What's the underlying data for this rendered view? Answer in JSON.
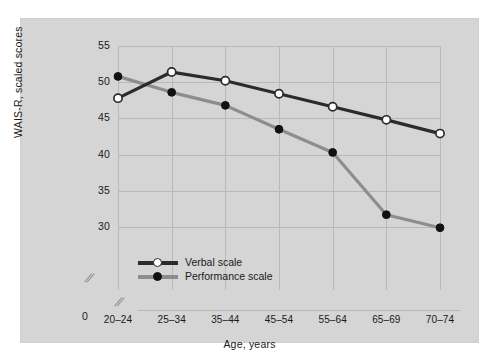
{
  "chart_data": {
    "type": "line",
    "title": "",
    "xlabel": "Age, years",
    "ylabel": "WAIS-R, scaled scores",
    "categories": [
      "20–24",
      "25–34",
      "35–44",
      "45–54",
      "55–64",
      "65–69",
      "70–74"
    ],
    "ylim": [
      28.5,
      55
    ],
    "yticks": [
      55,
      50,
      45,
      40,
      35,
      30
    ],
    "ytick_zero": "0",
    "grid": true,
    "legend_position": "bottom-left",
    "axis_break": "//",
    "series": [
      {
        "name": "Verbal scale",
        "color": "#2b2b2b",
        "marker": "open-circle",
        "values": [
          47.8,
          51.4,
          50.2,
          48.4,
          46.6,
          44.8,
          42.9
        ]
      },
      {
        "name": "Performance scale",
        "color": "#8d8d8d",
        "marker": "filled-circle",
        "values": [
          50.8,
          48.6,
          46.8,
          43.5,
          40.3,
          31.7,
          29.9
        ]
      }
    ]
  },
  "panel": {
    "background_color": "#d5d5d5",
    "gridline_color": "#b9b9b9"
  }
}
